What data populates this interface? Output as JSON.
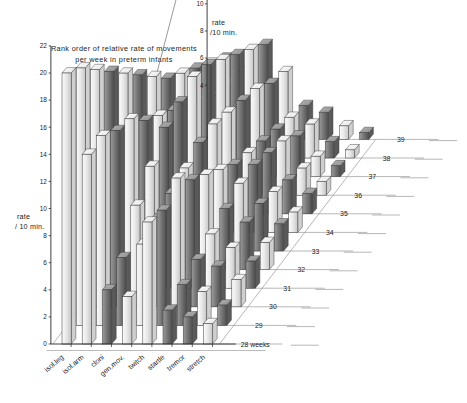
{
  "chart_data": {
    "type": "bar",
    "title": "Rank order of relative rate of movements per week in preterm infants",
    "title_line1": "Rank order of relative rate of movements",
    "title_line2": "per week in preterm infants",
    "xlabel": "",
    "ylabel": "rate /10 min.",
    "zlabel": "weeks",
    "grid": true,
    "legend_position": "none",
    "projection": "3d-isometric",
    "left_axis": {
      "label_line1": "rate",
      "label_line2": "/ 10 min.",
      "ticks": [
        0,
        2,
        4,
        6,
        8,
        10,
        12,
        14,
        16,
        18,
        20,
        22
      ],
      "ylim": [
        0,
        22
      ]
    },
    "top_axis": {
      "label_line1": "rate",
      "label_line2": "/10 min.",
      "ticks": [
        4,
        6,
        8,
        10,
        12,
        14,
        16,
        18
      ],
      "ylim": [
        0,
        18
      ]
    },
    "categories": [
      "isol.leg",
      "isol.arm",
      "cloni",
      "gen.mov.",
      "twitch",
      "startle",
      "tremor",
      "stretch"
    ],
    "depth_categories": [
      "28 weeks",
      "29",
      "30",
      "31",
      "32",
      "33",
      "34",
      "35",
      "36",
      "37",
      "38",
      "39"
    ],
    "depth_values": [
      28,
      29,
      30,
      31,
      32,
      33,
      34,
      35,
      36,
      37,
      38,
      39
    ],
    "series": [
      {
        "name": "28 weeks",
        "values": [
          20.0,
          14.0,
          4.0,
          3.5,
          9.0,
          2.5,
          2.0,
          1.5
        ]
      },
      {
        "name": "29",
        "values": [
          19.0,
          14.0,
          5.0,
          6.0,
          8.5,
          3.0,
          2.5,
          1.5
        ]
      },
      {
        "name": "30",
        "values": [
          17.5,
          13.0,
          7.5,
          6.5,
          9.5,
          3.5,
          3.0,
          2.0
        ]
      },
      {
        "name": "31",
        "values": [
          16.0,
          12.5,
          9.0,
          7.0,
          8.0,
          4.0,
          3.0,
          2.0
        ]
      },
      {
        "name": "32",
        "values": [
          14.5,
          11.0,
          10.5,
          7.5,
          7.0,
          4.5,
          3.5,
          2.0
        ]
      },
      {
        "name": "33",
        "values": [
          13.0,
          10.0,
          11.0,
          8.0,
          6.0,
          5.0,
          3.5,
          2.0
        ]
      },
      {
        "name": "34",
        "values": [
          11.5,
          9.0,
          11.5,
          8.0,
          5.0,
          5.0,
          3.0,
          1.5
        ]
      },
      {
        "name": "35",
        "values": [
          10.0,
          8.0,
          11.0,
          7.5,
          4.5,
          4.5,
          2.5,
          1.5
        ]
      },
      {
        "name": "36",
        "values": [
          9.0,
          7.0,
          10.0,
          7.0,
          4.0,
          4.0,
          2.0,
          1.0
        ]
      },
      {
        "name": "37",
        "values": [
          8.0,
          6.0,
          9.0,
          6.5,
          3.5,
          3.0,
          1.5,
          0.8
        ]
      },
      {
        "name": "38",
        "values": [
          7.0,
          5.5,
          8.0,
          5.5,
          3.0,
          2.5,
          1.2,
          0.6
        ]
      },
      {
        "name": "39",
        "values": [
          6.0,
          5.0,
          7.0,
          5.0,
          2.5,
          2.0,
          1.0,
          0.5
        ]
      }
    ],
    "shades": [
      [
        "light",
        "light",
        "dark",
        "light",
        "light",
        "dark",
        "dark",
        "light"
      ],
      [
        "light",
        "light",
        "dark",
        "light",
        "dark",
        "dark",
        "light",
        "dark"
      ],
      [
        "light",
        "dark",
        "light",
        "dark",
        "light",
        "dark",
        "dark",
        "light"
      ],
      [
        "dark",
        "light",
        "light",
        "dark",
        "dark",
        "light",
        "light",
        "dark"
      ],
      [
        "light",
        "dark",
        "dark",
        "light",
        "light",
        "dark",
        "dark",
        "light"
      ],
      [
        "dark",
        "light",
        "dark",
        "dark",
        "light",
        "light",
        "dark",
        "dark"
      ],
      [
        "light",
        "dark",
        "light",
        "light",
        "dark",
        "dark",
        "light",
        "light"
      ],
      [
        "dark",
        "light",
        "dark",
        "light",
        "light",
        "dark",
        "dark",
        "dark"
      ],
      [
        "light",
        "dark",
        "light",
        "dark",
        "dark",
        "light",
        "light",
        "light"
      ],
      [
        "dark",
        "light",
        "dark",
        "light",
        "dark",
        "dark",
        "light",
        "dark"
      ],
      [
        "light",
        "dark",
        "light",
        "dark",
        "light",
        "light",
        "dark",
        "light"
      ],
      [
        "dark",
        "light",
        "dark",
        "light",
        "dark",
        "dark",
        "light",
        "dark"
      ]
    ],
    "colors": {
      "bar_light": "#e2e2e2",
      "bar_dark": "#6f6f6f",
      "bar_top": "#f4f4f4",
      "axis": "#2a2a2a",
      "grid": "#9a9a9a",
      "text": "#1c1c1c",
      "background": "#ffffff"
    }
  }
}
